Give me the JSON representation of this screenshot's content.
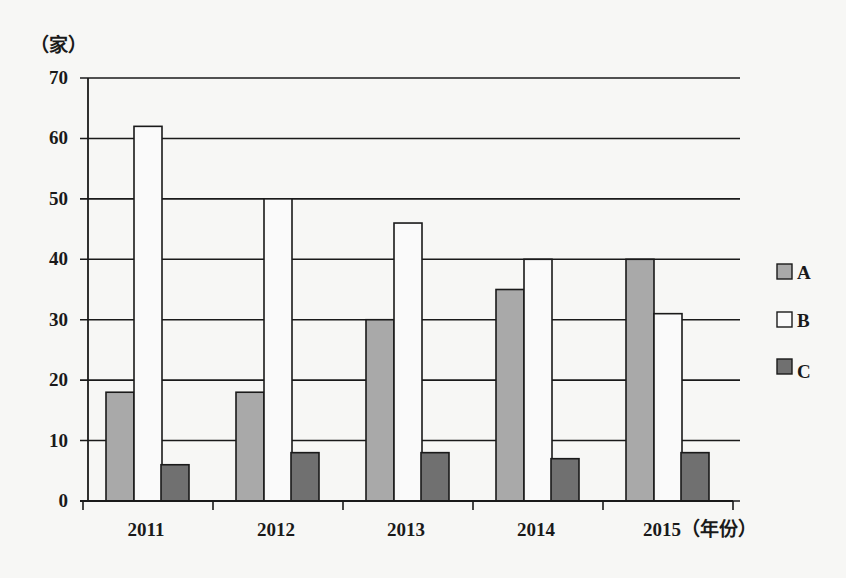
{
  "chart_data": {
    "type": "bar",
    "title": "",
    "xlabel": "（年份）",
    "ylabel": "（家）",
    "categories": [
      "2011",
      "2012",
      "2013",
      "2014",
      "2015"
    ],
    "series": [
      {
        "name": "A",
        "values": [
          18,
          18,
          30,
          35,
          40
        ],
        "color": "#a9a9a9"
      },
      {
        "name": "B",
        "values": [
          62,
          50,
          46,
          40,
          31
        ],
        "color": "#fafafa"
      },
      {
        "name": "C",
        "values": [
          6,
          8,
          8,
          7,
          8
        ],
        "color": "#707070"
      }
    ],
    "ylim": [
      0,
      70
    ],
    "yticks": [
      0,
      10,
      20,
      30,
      40,
      50,
      60,
      70
    ],
    "grid": true,
    "legend_position": "right"
  }
}
